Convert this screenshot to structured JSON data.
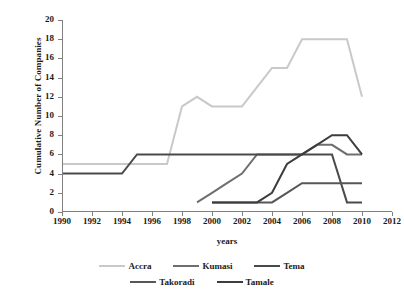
{
  "chart_data": {
    "type": "line",
    "title": "",
    "xlabel": "years",
    "ylabel": "Cumulative Number of Companies",
    "xlim": [
      1990,
      2012
    ],
    "ylim": [
      0,
      20
    ],
    "xticks": [
      1990,
      1992,
      1994,
      1996,
      1998,
      2000,
      2002,
      2004,
      2006,
      2008,
      2010,
      2012
    ],
    "yticks": [
      0,
      2,
      4,
      6,
      8,
      10,
      12,
      14,
      16,
      18,
      20
    ],
    "grid": false,
    "legend_position": "bottom",
    "series": [
      {
        "name": "Accra",
        "color": "#c9c9c9",
        "x": [
          1990,
          1991,
          1992,
          1993,
          1994,
          1995,
          1996,
          1997,
          1998,
          1999,
          2000,
          2001,
          2002,
          2003,
          2004,
          2005,
          2006,
          2007,
          2008,
          2009,
          2010
        ],
        "values": [
          5,
          5,
          5,
          5,
          5,
          5,
          5,
          5,
          11,
          12,
          11,
          11,
          11,
          13,
          15,
          15,
          18,
          18,
          18,
          18,
          12
        ]
      },
      {
        "name": "Kumasi",
        "color": "#6e6e6e",
        "x": [
          1999,
          2000,
          2001,
          2002,
          2003,
          2004,
          2005,
          2006,
          2007,
          2008,
          2009,
          2010
        ],
        "values": [
          1,
          2,
          3,
          4,
          6,
          6,
          6,
          6,
          7,
          7,
          6,
          6
        ]
      },
      {
        "name": "Tema",
        "color": "#4a4a4a",
        "x": [
          1990,
          1991,
          1992,
          1993,
          1994,
          1995,
          1996,
          1997,
          1998,
          1999,
          2000,
          2001,
          2002,
          2003,
          2004,
          2005,
          2006,
          2007,
          2008,
          2009,
          2010
        ],
        "values": [
          4,
          4,
          4,
          4,
          4,
          6,
          6,
          6,
          6,
          6,
          6,
          6,
          6,
          6,
          6,
          6,
          6,
          6,
          6,
          1,
          1
        ]
      },
      {
        "name": "Takoradi",
        "color": "#575757",
        "x": [
          2000,
          2001,
          2002,
          2003,
          2004,
          2005,
          2006,
          2007,
          2008,
          2009,
          2010
        ],
        "values": [
          1,
          1,
          1,
          1,
          1,
          2,
          3,
          3,
          3,
          3,
          3
        ]
      },
      {
        "name": "Tamale",
        "color": "#3d3d3d",
        "x": [
          2000,
          2001,
          2002,
          2003,
          2004,
          2005,
          2006,
          2007,
          2008,
          2009,
          2010
        ],
        "values": [
          1,
          1,
          1,
          1,
          2,
          5,
          6,
          7,
          8,
          8,
          6
        ]
      }
    ]
  },
  "axis": {
    "ylabel": "Cumulative Number of Companies",
    "xlabel": "years"
  },
  "legend": {
    "row1": [
      "Accra",
      "Kumasi",
      "Tema"
    ],
    "row2": [
      "Takoradi",
      "Tamale"
    ]
  }
}
